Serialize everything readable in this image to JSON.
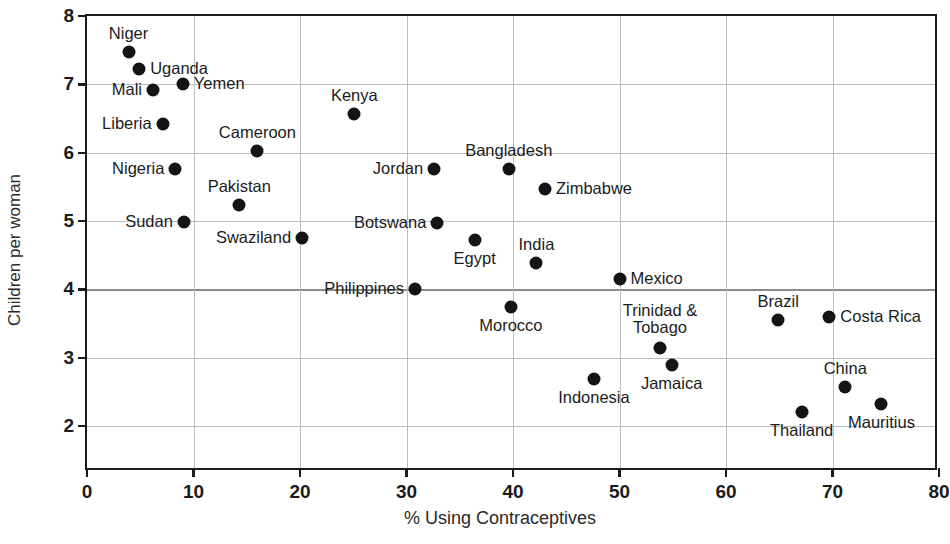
{
  "chart_data": {
    "type": "scatter",
    "title": "",
    "xlabel": "% Using Contraceptives",
    "ylabel": "Children per woman",
    "xlim": [
      0,
      80
    ],
    "ylim": [
      2,
      8
    ],
    "xticks": [
      "0",
      "10",
      "20",
      "30",
      "40",
      "50",
      "60",
      "70",
      "80"
    ],
    "yticks": [
      "2",
      "3",
      "4",
      "5",
      "6",
      "7",
      "8"
    ],
    "grid": true,
    "legend": "none",
    "marker_color": "#141414",
    "grid_color": "#bdbdbd",
    "axis_color": "#1b1b1b",
    "points": [
      {
        "label": "Niger",
        "x": 3.9,
        "y": 7.48,
        "pos": "top"
      },
      {
        "label": "Uganda",
        "x": 4.9,
        "y": 7.22,
        "pos": "right"
      },
      {
        "label": "Mali",
        "x": 6.2,
        "y": 6.92,
        "pos": "left"
      },
      {
        "label": "Yemen",
        "x": 9.0,
        "y": 7.0,
        "pos": "right"
      },
      {
        "label": "Liberia",
        "x": 7.1,
        "y": 6.42,
        "pos": "left"
      },
      {
        "label": "Nigeria",
        "x": 8.3,
        "y": 5.76,
        "pos": "left"
      },
      {
        "label": "Sudan",
        "x": 9.1,
        "y": 4.98,
        "pos": "left"
      },
      {
        "label": "Pakistan",
        "x": 14.3,
        "y": 5.24,
        "pos": "top"
      },
      {
        "label": "Cameroon",
        "x": 16.0,
        "y": 6.03,
        "pos": "top"
      },
      {
        "label": "Swaziland",
        "x": 20.2,
        "y": 4.76,
        "pos": "left"
      },
      {
        "label": "Kenya",
        "x": 25.1,
        "y": 6.56,
        "pos": "top"
      },
      {
        "label": "Philippines",
        "x": 30.8,
        "y": 4.0,
        "pos": "left"
      },
      {
        "label": "Jordan",
        "x": 32.6,
        "y": 5.76,
        "pos": "left"
      },
      {
        "label": "Botswana",
        "x": 32.9,
        "y": 4.97,
        "pos": "left"
      },
      {
        "label": "Egypt",
        "x": 36.4,
        "y": 4.72,
        "pos": "bottom"
      },
      {
        "label": "Bangladesh",
        "x": 39.6,
        "y": 5.76,
        "pos": "top"
      },
      {
        "label": "Morocco",
        "x": 39.8,
        "y": 3.74,
        "pos": "bottom"
      },
      {
        "label": "India",
        "x": 42.2,
        "y": 4.38,
        "pos": "top"
      },
      {
        "label": "Zimbabwe",
        "x": 43.0,
        "y": 5.47,
        "pos": "right"
      },
      {
        "label": "Indonesia",
        "x": 47.6,
        "y": 2.69,
        "pos": "bottom"
      },
      {
        "label": "Mexico",
        "x": 50.0,
        "y": 4.16,
        "pos": "right"
      },
      {
        "label": "Trinidad &\nTobago",
        "x": 53.8,
        "y": 3.15,
        "pos": "top2"
      },
      {
        "label": "Jamaica",
        "x": 54.9,
        "y": 2.9,
        "pos": "bottom"
      },
      {
        "label": "Brazil",
        "x": 64.9,
        "y": 3.56,
        "pos": "top"
      },
      {
        "label": "Thailand",
        "x": 67.1,
        "y": 2.21,
        "pos": "bottom"
      },
      {
        "label": "Costa Rica",
        "x": 69.7,
        "y": 3.6,
        "pos": "right"
      },
      {
        "label": "China",
        "x": 71.2,
        "y": 2.57,
        "pos": "top"
      },
      {
        "label": "Mauritius",
        "x": 74.6,
        "y": 2.33,
        "pos": "bottom"
      }
    ],
    "reference_line": {
      "y": 4,
      "emphasized": true,
      "x_from": 0,
      "x_to": 50
    }
  }
}
